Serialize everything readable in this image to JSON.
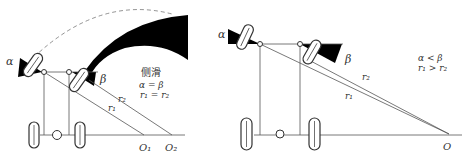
{
  "left_panel": {
    "label_alpha": "α",
    "label_beta": "β",
    "label_r1": "r₁",
    "label_r2": "r₂",
    "label_o1": "O₁",
    "label_o2": "O₂",
    "caption_title": "侧滑",
    "caption_eq1": "α = β",
    "caption_eq2": "r₁ = r₂"
  },
  "right_panel": {
    "label_alpha": "α",
    "label_beta": "β",
    "label_r1": "r₁",
    "label_r2": "r₂",
    "label_o": "O",
    "caption_eq1": "α < β",
    "caption_eq2": "r₁ > r₂"
  }
}
